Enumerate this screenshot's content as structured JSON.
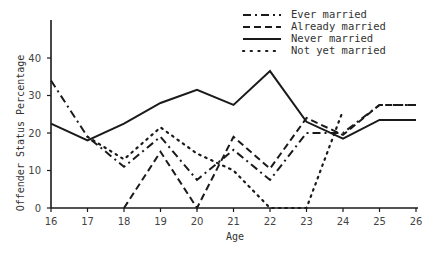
{
  "chart_data": {
    "type": "line",
    "title": "",
    "xlabel": "Age",
    "ylabel": "Offender Status Percentage",
    "x": [
      16,
      17,
      18,
      19,
      20,
      21,
      22,
      23,
      24,
      25,
      26
    ],
    "xlim": [
      16,
      26
    ],
    "ylim": [
      0,
      50
    ],
    "yticks": [
      0,
      10,
      20,
      30,
      40
    ],
    "xticks": [
      16,
      17,
      18,
      19,
      20,
      21,
      22,
      23,
      24,
      25,
      26
    ],
    "grid": false,
    "legend_position": "top-right",
    "series": [
      {
        "name": "Ever married",
        "style": "dash-dot",
        "values": [
          34,
          19,
          11,
          19,
          7.5,
          15.5,
          7.5,
          20,
          20,
          27.5,
          27.5
        ]
      },
      {
        "name": "Already married",
        "style": "dashed",
        "values": [
          null,
          null,
          0,
          15,
          0,
          19,
          10.5,
          24,
          19.5,
          27.5,
          27.5
        ]
      },
      {
        "name": "Never married",
        "style": "solid",
        "values": [
          22.5,
          18,
          22.5,
          28,
          31.5,
          27.5,
          36.5,
          23,
          18.5,
          23.5,
          23.5
        ]
      },
      {
        "name": "Not yet married",
        "style": "dotted",
        "values": [
          null,
          19,
          13,
          21.5,
          14.5,
          10,
          0,
          0,
          26,
          null,
          null
        ]
      }
    ]
  },
  "legend": {
    "items": [
      {
        "label": "Ever married"
      },
      {
        "label": "Already married"
      },
      {
        "label": "Never married"
      },
      {
        "label": "Not yet married"
      }
    ]
  },
  "axes": {
    "x_title": "Age",
    "y_title": "Offender Status Percentage",
    "x_tick_labels": [
      "16",
      "17",
      "18",
      "19",
      "20",
      "21",
      "22",
      "23",
      "24",
      "25",
      "26"
    ],
    "y_tick_labels": [
      "0",
      "10",
      "20",
      "30",
      "40"
    ]
  },
  "colors": {
    "line": "#1a1a1a",
    "axis": "#1a1a1a",
    "text": "#333333",
    "background": "#ffffff"
  }
}
